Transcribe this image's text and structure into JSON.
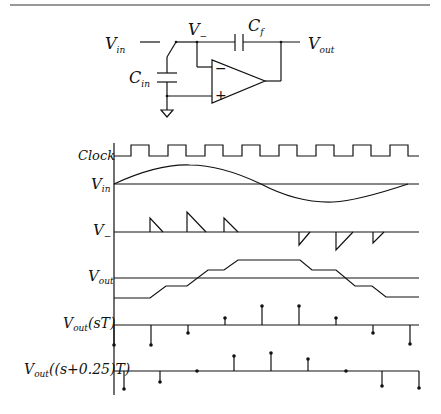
{
  "figure": {
    "type": "switched-capacitor integrator schematic with timing waveforms"
  },
  "circuit": {
    "labels": {
      "vin": "V",
      "vin_sub": "in",
      "vminus": "V",
      "vminus_sub": "−",
      "cf": "C",
      "cf_sub": "f",
      "vout": "V",
      "vout_sub": "out",
      "cin": "C",
      "cin_sub": "in",
      "opamp_minus": "−",
      "opamp_plus": "+"
    }
  },
  "waveforms": {
    "rows": [
      {
        "id": "clock",
        "label": "Clock",
        "label_sub": ""
      },
      {
        "id": "vin",
        "label": "V",
        "label_sub": "in"
      },
      {
        "id": "vminus",
        "label": "V",
        "label_sub": "−"
      },
      {
        "id": "vout",
        "label": "V",
        "label_sub": "out"
      },
      {
        "id": "vout_sT",
        "label": "V",
        "label_sub": "out",
        "label_suffix": "(sT)"
      },
      {
        "id": "vout_s025T",
        "label": "V",
        "label_sub": "out",
        "label_suffix": "((s+0.25)T)"
      }
    ],
    "clock_cycles": 8,
    "vout_sT_samples": [
      -0.9,
      -0.8,
      -0.3,
      0.3,
      0.8,
      0.8,
      0.3,
      -0.3,
      -0.8
    ],
    "vout_s025T_samples": [
      -1.0,
      -0.6,
      0.0,
      0.8,
      1.0,
      0.6,
      0.0,
      -0.8,
      -1.0
    ]
  }
}
